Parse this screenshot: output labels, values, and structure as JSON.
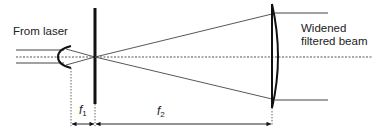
{
  "diagram": {
    "type": "optical-schematic",
    "colors": {
      "line": "#333333",
      "background": "#ffffff"
    },
    "labels": {
      "source": "From laser",
      "output_line1": "Widened",
      "output_line2": "filtered beam"
    },
    "dimensions": {
      "f1": {
        "symbol": "f",
        "subscript": "1"
      },
      "f2": {
        "symbol": "f",
        "subscript": "2"
      }
    },
    "components": [
      {
        "name": "focusing-lens",
        "kind": "small plano-convex lens"
      },
      {
        "name": "pinhole-aperture",
        "kind": "opaque plate with pinhole at focal point"
      },
      {
        "name": "collimating-lens",
        "kind": "large plano-convex lens"
      }
    ]
  }
}
